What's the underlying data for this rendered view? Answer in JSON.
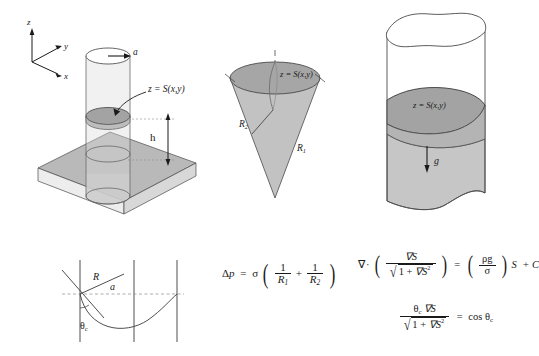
{
  "figure": {
    "caption_present": false,
    "background": "#ffffff",
    "ink": "#1a1a1a",
    "fill_mid_gray": "#a8a8a8",
    "fill_light_gray": "#c9c9c9",
    "fill_pale_gray": "#e4e4e4"
  },
  "panel_a": {
    "name": "capillary-tube-on-plate",
    "axes": {
      "z": "z",
      "y": "y",
      "x": "x"
    },
    "radius_label": "a",
    "surface_label": "z = S(x,y)",
    "height_label": "h"
  },
  "panel_b": {
    "name": "cone-meniscus",
    "surface_label": "z = S(x,y)",
    "radius_minor_label": "R",
    "radius_minor_sub": "2",
    "radius_major_label": "R",
    "radius_major_sub": "1"
  },
  "panel_c": {
    "name": "irregular-cylinder-meniscus",
    "surface_label": "z = S(x,y)",
    "gravity_label": "g"
  },
  "panel_d": {
    "name": "contact-angle-geometry",
    "radius_label": "R",
    "half_width_label": "a",
    "contact_angle_label": "θ",
    "contact_angle_sub": "c"
  },
  "equations": {
    "young_laplace": {
      "name": "young-laplace-equation",
      "lhs_delta": "Δ",
      "lhs_p": "p",
      "equals": "=",
      "sigma": "σ",
      "one": "1",
      "R1": "R",
      "R1_sub": "1",
      "R2": "R",
      "R2_sub": "2",
      "plus": "+"
    },
    "governing": {
      "name": "governing-pde",
      "nabla": "∇",
      "dot": "·",
      "grad_S": "∇S",
      "one_plus": "1 + ",
      "grad_S_sq": "∇S",
      "sq": "2",
      "equals": "=",
      "rho_g": "ρg",
      "sigma": "σ",
      "S": "S",
      "plus_C": "+ C"
    },
    "boundary": {
      "name": "contact-angle-boundary-condition",
      "theta": "θ",
      "theta_sub": "c",
      "grad_S": "∇S",
      "one_plus": "1 + ",
      "grad_S_sq": "∇S",
      "sq": "2",
      "equals": "=",
      "cos": "cos ",
      "cos_theta": "θ",
      "cos_theta_sub": "c"
    }
  }
}
